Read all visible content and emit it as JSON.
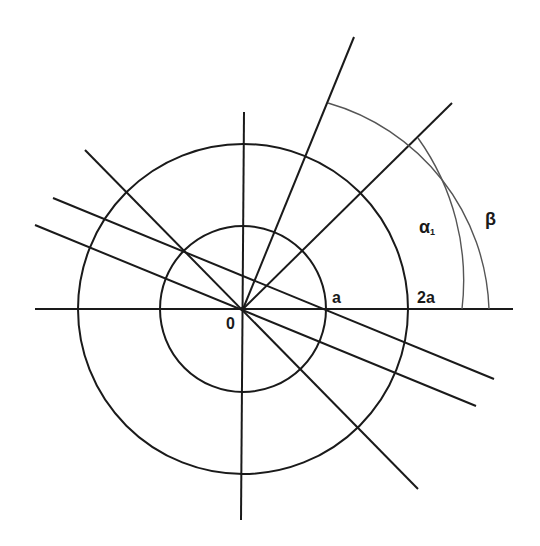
{
  "diagram": {
    "type": "geometric-construction",
    "center": {
      "x": 243,
      "y": 309
    },
    "stroke_color": "#1a1a1a",
    "arc_color": "#555555",
    "circles": [
      {
        "name": "inner-circle",
        "radius": 83,
        "radius_label": "a"
      },
      {
        "name": "outer-circle",
        "radius": 165,
        "radius_label": "2a"
      }
    ],
    "lines": [
      {
        "name": "horizontal-axis",
        "x1": 35,
        "y1": 309,
        "x2": 513,
        "y2": 309
      },
      {
        "name": "vertical-axis",
        "x1": 244,
        "y1": 112,
        "x2": 241,
        "y2": 520
      },
      {
        "name": "steep-ray",
        "x1": 243,
        "y1": 309,
        "x2": 354,
        "y2": 37
      },
      {
        "name": "diagonal-ray-45",
        "x1": 243,
        "y1": 309,
        "x2": 452,
        "y2": 103
      },
      {
        "name": "diagonal-line",
        "x1": 85,
        "y1": 150,
        "x2": 418,
        "y2": 489
      },
      {
        "name": "offset-line-upper",
        "x1": 53,
        "y1": 198,
        "x2": 494,
        "y2": 379
      },
      {
        "name": "offset-line-lower",
        "x1": 35,
        "y1": 225,
        "x2": 476,
        "y2": 406
      }
    ],
    "arcs": [
      {
        "name": "alpha-arc",
        "radius": 219,
        "label": "α",
        "subscript": "1"
      },
      {
        "name": "beta-arc",
        "radius": 246,
        "label": "β"
      }
    ],
    "labels": {
      "origin": "0",
      "a": "a",
      "two_a": "2a",
      "alpha": "α",
      "alpha_sub": "1",
      "beta": "β"
    }
  }
}
